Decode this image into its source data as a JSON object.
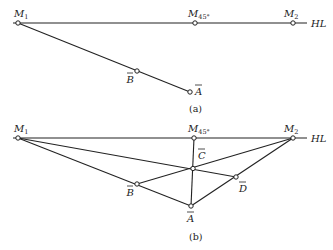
{
  "figure_a": {
    "caption": "(a)",
    "horizon_label": "HL",
    "points": {
      "M1": {
        "base": "M",
        "sub": "1"
      },
      "M45": {
        "base": "M",
        "sub": "45°"
      },
      "M2": {
        "base": "M",
        "sub": "2"
      },
      "B": {
        "base": "B",
        "overline": true
      },
      "A": {
        "base": "A",
        "overline": true
      }
    }
  },
  "figure_b": {
    "caption": "(b)",
    "horizon_label": "HL",
    "points": {
      "M1": {
        "base": "M",
        "sub": "1"
      },
      "M45": {
        "base": "M",
        "sub": "45°"
      },
      "M2": {
        "base": "M",
        "sub": "2"
      },
      "C": {
        "base": "C",
        "overline": true
      },
      "B": {
        "base": "B",
        "overline": true
      },
      "A": {
        "base": "A",
        "overline": true
      },
      "D": {
        "base": "D",
        "overline": true
      }
    }
  }
}
